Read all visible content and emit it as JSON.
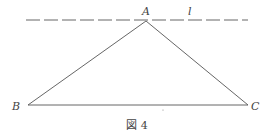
{
  "figure": {
    "caption": "図 4",
    "stroke_color": "#555555",
    "line": {
      "label": "l",
      "style": "dashed",
      "x1": 26,
      "y1": 20,
      "x2": 248,
      "y2": 20
    },
    "points": {
      "A": {
        "label": "A",
        "x": 146,
        "y": 21
      },
      "B": {
        "label": "B",
        "x": 28,
        "y": 105
      },
      "C": {
        "label": "C",
        "x": 248,
        "y": 105
      }
    },
    "segments": [
      [
        "A",
        "B"
      ],
      [
        "A",
        "C"
      ],
      [
        "B",
        "C"
      ]
    ]
  }
}
